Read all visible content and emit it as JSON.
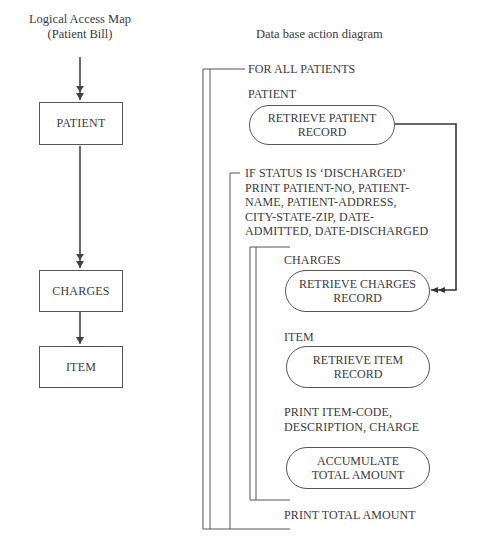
{
  "left_panel": {
    "title_line1": "Logical Access Map",
    "title_line2": "(Patient Bill)",
    "boxes": [
      {
        "label": "PATIENT"
      },
      {
        "label": "CHARGES"
      },
      {
        "label": "ITEM"
      }
    ]
  },
  "right_panel": {
    "title": "Data base action diagram",
    "for_all": "FOR ALL PATIENTS",
    "patient_label": "PATIENT",
    "retrieve_patient": {
      "line1": "RETRIEVE PATIENT",
      "line2": "RECORD"
    },
    "if_status": [
      "IF STATUS IS ‘DISCHARGED’",
      "PRINT PATIENT-NO, PATIENT-",
      "NAME, PATIENT-ADDRESS,",
      "CITY-STATE-ZIP, DATE-",
      "ADMITTED, DATE-DISCHARGED"
    ],
    "charges_label": "CHARGES",
    "retrieve_charges": {
      "line1": "RETRIEVE CHARGES",
      "line2": "RECORD"
    },
    "item_label": "ITEM",
    "retrieve_item": {
      "line1": "RETRIEVE ITEM",
      "line2": "RECORD"
    },
    "print_item": [
      "PRINT ITEM-CODE,",
      "DESCRIPTION, CHARGE"
    ],
    "accumulate": {
      "line1": "ACCUMULATE",
      "line2": "TOTAL AMOUNT"
    },
    "print_total": "PRINT TOTAL AMOUNT"
  }
}
